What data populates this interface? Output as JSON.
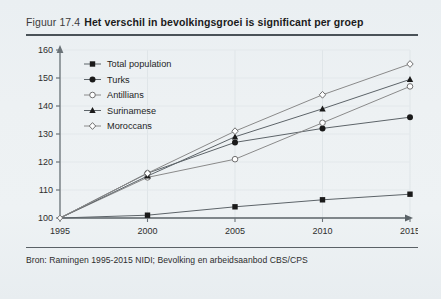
{
  "figure": {
    "number": "Figuur 17.4",
    "title": "Het verschil in bevolkingsgroei is significant per groep",
    "source": "Bron: Ramingen 1995-2015 NIDI; Bevolking en arbeidsaanbod CBS/CPS"
  },
  "chart_data": {
    "type": "line",
    "title": "Het verschil in bevolkingsgroei is significant per groep",
    "xlabel": "",
    "ylabel": "",
    "x": [
      1995,
      2000,
      2005,
      2010,
      2015
    ],
    "xtick_labels": [
      "1995",
      "2000",
      "2005",
      "2010",
      "2015"
    ],
    "ytick_labels": [
      "100",
      "110",
      "120",
      "130",
      "140",
      "150",
      "160"
    ],
    "yticks": [
      100,
      110,
      120,
      130,
      140,
      150,
      160
    ],
    "ylim": [
      100,
      160
    ],
    "xlim": [
      1995,
      2015
    ],
    "grid": true,
    "legend_position": "top-left",
    "series": [
      {
        "name": "Total population",
        "marker": "filled-square",
        "color": "#1a1a1a",
        "values": [
          100,
          101,
          104,
          106.5,
          108.5
        ]
      },
      {
        "name": "Turks",
        "marker": "filled-circle",
        "color": "#1a1a1a",
        "values": [
          100,
          116,
          127,
          132,
          136
        ]
      },
      {
        "name": "Antillians",
        "marker": "open-circle",
        "color": "#6f6f6f",
        "values": [
          100,
          114.5,
          121,
          134,
          147
        ]
      },
      {
        "name": "Surinamese",
        "marker": "filled-triangle",
        "color": "#1a1a1a",
        "values": [
          100,
          115,
          129,
          139,
          149.5
        ]
      },
      {
        "name": "Moroccans",
        "marker": "open-diamond",
        "color": "#6f6f6f",
        "values": [
          100,
          116,
          131,
          144,
          155
        ]
      }
    ]
  }
}
